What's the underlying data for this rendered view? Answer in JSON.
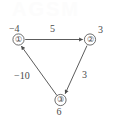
{
  "figure": {
    "background_color": "#ffffff",
    "ink_color": "#4a4a4a",
    "watermark_text": "AGSM"
  },
  "graph": {
    "type": "directed-weighted-graph",
    "nodes": [
      {
        "id": "1",
        "glyph": "①",
        "value_label": "−4",
        "x": 18.5,
        "y": 39.5,
        "label_x": 9,
        "label_y": 24
      },
      {
        "id": "2",
        "glyph": "②",
        "value_label": "3",
        "x": 90.0,
        "y": 39.5,
        "label_x": 98,
        "label_y": 25
      },
      {
        "id": "3",
        "glyph": "③",
        "value_label": "6",
        "x": 60.5,
        "y": 100.0,
        "label_x": 56,
        "label_y": 107
      }
    ],
    "edges": [
      {
        "from": "1",
        "to": "2",
        "weight_label": "5",
        "label_x": 50,
        "label_y": 24
      },
      {
        "from": "2",
        "to": "3",
        "weight_label": "3",
        "label_x": 82,
        "label_y": 70
      },
      {
        "from": "3",
        "to": "1",
        "weight_label": "−10",
        "label_x": 14,
        "label_y": 71
      }
    ]
  }
}
